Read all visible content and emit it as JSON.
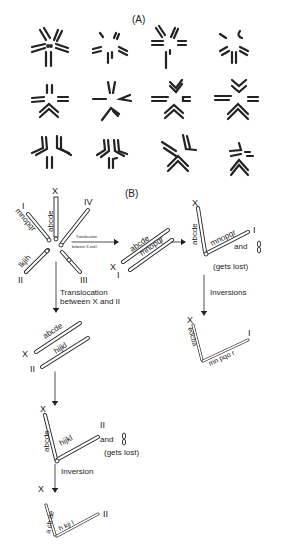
{
  "panel_a": {
    "label": "(A)",
    "description": "12 karyotype sketches in 3 rows x 4 columns showing chromosome arrangements"
  },
  "panel_b": {
    "label": "(B)",
    "start": {
      "chromosomes": [
        "I",
        "X",
        "IV",
        "II",
        "III"
      ],
      "arm_labels": {
        "I": "mnopqr",
        "X": "abcde",
        "II": "lkjih"
      }
    },
    "arrow_right": {
      "line1": "Translocation",
      "line2": "between X and I"
    },
    "arrow_down": {
      "line1": "Translocation",
      "line2": "between X and II"
    },
    "right_branch": {
      "intermediate": {
        "x_label": "X",
        "i_label": "I",
        "arm1": "abcde",
        "arm2": "mnopqr"
      },
      "product": {
        "x_label": "X",
        "i_label": "I",
        "arm_x": "abcde",
        "arm_i": "mnopqr",
        "and_text": "and",
        "lost_text": "(gets lost)"
      },
      "inversions_label": "Inversions",
      "final": {
        "x_label": "X",
        "i_label": "I",
        "arm_x": "edcba",
        "arm_i": "mn pqo r"
      }
    },
    "left_branch": {
      "intermediate": {
        "x_label": "X",
        "ii_label": "II",
        "arm1": "abcde",
        "arm2": "hijkl"
      },
      "product": {
        "x_label": "X",
        "ii_label": "II",
        "arm_x": "abcde",
        "arm_ii": "hijkl",
        "and_text": "and",
        "lost_text": "(gets lost)"
      },
      "inversion_label": "Inversion",
      "final": {
        "x_label": "X",
        "ii_label": "II",
        "arm_x": "a cb de",
        "arm_ii": "h kji l"
      }
    }
  }
}
